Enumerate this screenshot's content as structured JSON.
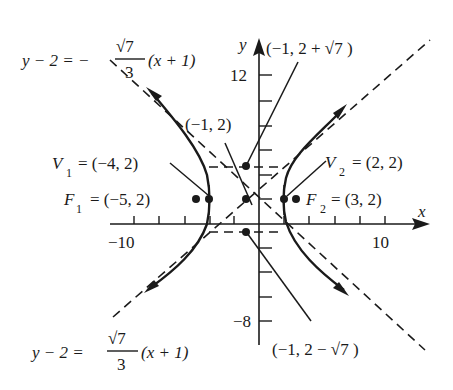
{
  "figure": {
    "type": "hyperbola-graph",
    "equation_shape": "(x+1)^2/9 - (y-2)^2/7 = 1",
    "axes": {
      "x_label": "x",
      "y_label": "y",
      "x_tick_labels": {
        "min": "−10",
        "max": "10"
      },
      "y_tick_labels": {
        "max": "12",
        "min": "−8"
      },
      "x_tick_step": 2,
      "y_tick_step": 2
    },
    "center": {
      "label": "(−1, 2)",
      "x": -1,
      "y": 2
    },
    "vertices": [
      {
        "name": "V",
        "sub": "1",
        "coords": "= (−4, 2)",
        "x": -4,
        "y": 2
      },
      {
        "name": "V",
        "sub": "2",
        "coords": "= (2, 2)",
        "x": 2,
        "y": 2
      }
    ],
    "foci": [
      {
        "name": "F",
        "sub": "1",
        "coords": "= (−5, 2)",
        "x": -5,
        "y": 2
      },
      {
        "name": "F",
        "sub": "2",
        "coords": "= (3, 2)",
        "x": 3,
        "y": 2
      }
    ],
    "conjugate_points": [
      {
        "label_prefix": "(−1, 2 + ",
        "label_root": "√7",
        "label_suffix": " )",
        "x": -1,
        "y": 4.6458
      },
      {
        "label_prefix": "(−1, 2 − ",
        "label_root": "√7",
        "label_suffix": " )",
        "x": -1,
        "y": -0.6458
      }
    ],
    "asymptotes": [
      {
        "lhs": "y − 2 = −",
        "num": "√7",
        "den": "3",
        "rhs": "(x + 1)",
        "slope_sign": "negative"
      },
      {
        "lhs": "y − 2 = ",
        "num": "√7",
        "den": "3",
        "rhs": "(x + 1)",
        "slope_sign": "positive"
      }
    ],
    "a": 3,
    "b": "√7",
    "c": 4,
    "colors": {
      "ink": "#1a1a1a",
      "background": "#ffffff"
    }
  }
}
